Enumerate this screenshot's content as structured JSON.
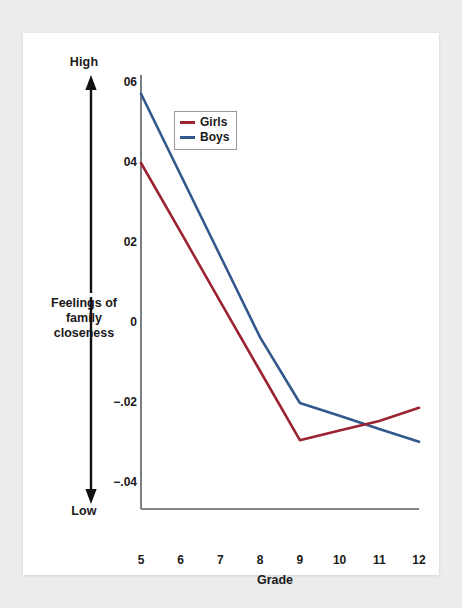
{
  "chart_data": {
    "type": "line",
    "title": "",
    "xlabel": "Grade",
    "ylabel": "Feelings of family closeness",
    "x": [
      5,
      6,
      7,
      8,
      9,
      10,
      11,
      12
    ],
    "xtick_labels": [
      "5",
      "6",
      "7",
      "8",
      "9",
      "10",
      "11",
      "12"
    ],
    "ytick_labels": [
      "06",
      "04",
      "02",
      "0",
      "−.02",
      "−.04"
    ],
    "ytick_values": [
      0.06,
      0.04,
      0.02,
      0,
      -0.02,
      -0.04
    ],
    "ylim": [
      -0.04,
      0.06
    ],
    "grid": false,
    "legend_position": "top-left-inside",
    "axis_direction": {
      "high_label": "High",
      "low_label": "Low"
    },
    "series": [
      {
        "name": "Girls",
        "color": "#9b2433",
        "values": [
          0.04,
          0.0227,
          0.0053,
          -0.012,
          -0.0293,
          -0.0269,
          -0.0245,
          -0.0212
        ]
      },
      {
        "name": "Boys",
        "color": "#32588c",
        "values": [
          0.0573,
          0.037,
          0.0167,
          -0.0036,
          -0.02,
          -0.0232,
          -0.0265,
          -0.0297
        ]
      }
    ]
  },
  "legend": {
    "items": [
      {
        "label": "Girls",
        "color": "#9b2433"
      },
      {
        "label": "Boys",
        "color": "#32588c"
      }
    ]
  },
  "axis": {
    "x_title": "Grade",
    "y_caption_lines": [
      "Feelings of",
      "family",
      "closeness"
    ],
    "high": "High",
    "low": "Low"
  },
  "colors": {
    "girls": "#9b2433",
    "boys": "#32588c",
    "axis": "#5b5f63",
    "text": "#1a1a1a",
    "card": "#ffffff",
    "page_background": "#ececed"
  }
}
